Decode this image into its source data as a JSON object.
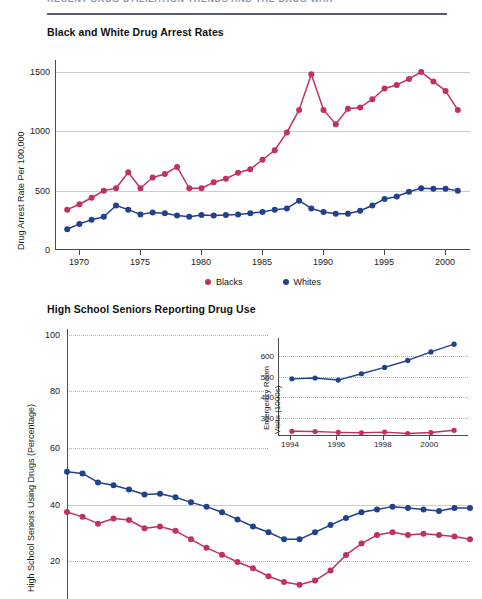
{
  "running_head": {
    "text": "RECENT DRUG UTILIZATION TRENDS AND THE DRUG WAR"
  },
  "figures": [
    {
      "title": "Black and White Drug Arrest Rates",
      "ylabel": "Drug Arrest Rate Per 100,000",
      "yticks": [
        "0",
        "500",
        "1000",
        "1500"
      ],
      "xticks": [
        "1970",
        "1975",
        "1980",
        "1985",
        "1990",
        "1995",
        "2000"
      ],
      "legend": [
        {
          "label": "Blacks",
          "color": "#c2315c"
        },
        {
          "label": "Whites",
          "color": "#20418c"
        }
      ]
    },
    {
      "title": "High School Seniors Reporting Drug Use",
      "ylabel": "High School Seniors Using Drugs (Percentage)",
      "yticks": [
        "20",
        "40",
        "60",
        "80",
        "100"
      ]
    }
  ],
  "inset": {
    "ylabel_line1": "Emergency Room",
    "ylabel_line2": "Visits (1000s)",
    "yticks": [
      "300",
      "400",
      "500",
      "600"
    ],
    "xticks": [
      "1994",
      "1996",
      "1998",
      "2000"
    ]
  },
  "colors": {
    "blacks": "#c2315c",
    "whites": "#20418c",
    "axis": "#4a4a4a",
    "grid": "#9aa0ad",
    "rule": "#555a66"
  },
  "chart_data": [
    {
      "type": "line",
      "id": "drug-arrest-rates",
      "title": "Black and White Drug Arrest Rates",
      "xlabel": "",
      "ylabel": "Drug Arrest Rate Per 100,000",
      "xlim": [
        1968,
        2002
      ],
      "ylim": [
        0,
        1600
      ],
      "yticks": [
        0,
        500,
        1000,
        1500
      ],
      "xticks": [
        1970,
        1975,
        1980,
        1985,
        1990,
        1995,
        2000
      ],
      "grid": true,
      "legend_position": "bottom-center",
      "x": [
        1969,
        1970,
        1971,
        1972,
        1973,
        1974,
        1975,
        1976,
        1977,
        1978,
        1979,
        1980,
        1981,
        1982,
        1983,
        1984,
        1985,
        1986,
        1987,
        1988,
        1989,
        1990,
        1991,
        1992,
        1993,
        1994,
        1995,
        1996,
        1997,
        1998,
        1999,
        2000,
        2001
      ],
      "series": [
        {
          "name": "Blacks",
          "color": "#c2315c",
          "values": [
            340,
            385,
            440,
            500,
            520,
            655,
            520,
            610,
            640,
            700,
            520,
            520,
            570,
            600,
            650,
            680,
            760,
            840,
            990,
            1180,
            1480,
            1180,
            1060,
            1190,
            1200,
            1270,
            1360,
            1390,
            1440,
            1500,
            1420,
            1340,
            1180
          ]
        },
        {
          "name": "Whites",
          "color": "#20418c",
          "values": [
            175,
            220,
            255,
            280,
            375,
            340,
            300,
            315,
            310,
            290,
            280,
            295,
            290,
            295,
            300,
            310,
            320,
            340,
            350,
            415,
            350,
            320,
            305,
            305,
            330,
            375,
            430,
            450,
            490,
            520,
            515,
            515,
            500
          ]
        }
      ]
    },
    {
      "type": "line",
      "id": "hs-seniors-drug-use",
      "title": "High School Seniors Reporting Drug Use",
      "xlabel": "",
      "ylabel": "High School Seniors Using Drugs (Percentage)",
      "ylim": [
        10,
        105
      ],
      "yticks": [
        20,
        40,
        60,
        80,
        100
      ],
      "grid": true,
      "x": [
        1975,
        1976,
        1977,
        1978,
        1979,
        1980,
        1981,
        1982,
        1983,
        1984,
        1985,
        1986,
        1987,
        1988,
        1989,
        1990,
        1991,
        1992,
        1993,
        1994,
        1995,
        1996,
        1997,
        1998,
        1999,
        2000,
        2001
      ],
      "series": [
        {
          "name": "Blacks",
          "color": "#c2315c",
          "values": [
            40.6,
            38.9,
            36.5,
            38.3,
            37.8,
            34.9,
            35.5,
            34.0,
            31.0,
            28.0,
            25.6,
            23.0,
            20.8,
            18.0,
            16.0,
            15.0,
            16.5,
            20.0,
            25.5,
            29.5,
            32.5,
            33.5,
            32.5,
            33.0,
            32.5,
            32.0,
            31.0
          ]
        },
        {
          "name": "Whites",
          "color": "#20418c",
          "values": [
            54.8,
            54.2,
            51.0,
            50.0,
            48.5,
            46.8,
            47.0,
            45.8,
            44.0,
            42.5,
            40.5,
            38.0,
            35.5,
            33.5,
            31.0,
            31.0,
            33.5,
            36.0,
            38.5,
            40.5,
            41.5,
            42.5,
            42.0,
            41.5,
            41.0,
            42.0,
            42.0
          ]
        }
      ]
    },
    {
      "type": "line",
      "id": "emergency-room-visits",
      "title": "",
      "xlabel": "",
      "ylabel": "Emergency Room Visits (1000s)",
      "xlim": [
        1993.4,
        2001.6
      ],
      "ylim": [
        210,
        690
      ],
      "yticks": [
        300,
        400,
        500,
        600
      ],
      "xticks": [
        1994,
        1996,
        1998,
        2000
      ],
      "grid": true,
      "x": [
        1994,
        1995,
        1996,
        1997,
        1998,
        1999,
        2000,
        2001
      ],
      "series": [
        {
          "name": "Whites",
          "color": "#20418c",
          "values": [
            490,
            494,
            484,
            515,
            546,
            580,
            622,
            660
          ]
        },
        {
          "name": "Blacks",
          "color": "#c2315c",
          "values": [
            233,
            232,
            228,
            226,
            229,
            222,
            227,
            238
          ]
        }
      ]
    }
  ]
}
